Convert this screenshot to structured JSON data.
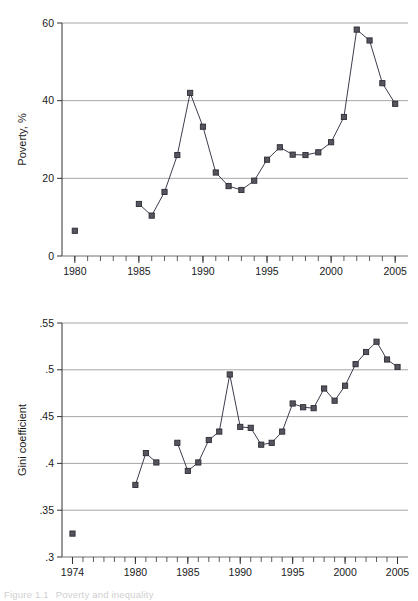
{
  "figure": {
    "caption_number": "Figure 1.1",
    "caption_text": "Poverty and inequality"
  },
  "chart_data": [
    {
      "type": "line",
      "id": "poverty",
      "title": "",
      "xlabel": "",
      "ylabel": "Poverty, %",
      "xlim": [
        1979,
        2006
      ],
      "ylim": [
        0,
        60
      ],
      "grid": true,
      "legend": "none",
      "marker": "square",
      "color": "#3d3d4f",
      "ytick_labels": [
        "0",
        "20",
        "40",
        "60"
      ],
      "ytick_values": [
        0,
        20,
        40,
        60
      ],
      "xtick_labels": [
        "1980",
        "1985",
        "1990",
        "1995",
        "2000",
        "2005"
      ],
      "xtick_values": [
        1980,
        1985,
        1990,
        1995,
        2000,
        2005
      ],
      "xminor_step": 1,
      "segments": [
        {
          "name": "isolated-1980",
          "x": [
            1980
          ],
          "y": [
            6.5
          ]
        },
        {
          "name": "main",
          "x": [
            1985,
            1986,
            1987,
            1988,
            1989,
            1990,
            1991,
            1992,
            1993,
            1994,
            1995,
            1996,
            1997,
            1998,
            1999,
            2000,
            2001,
            2002,
            2003,
            2004,
            2005
          ],
          "y": [
            13.4,
            10.4,
            16.5,
            26.0,
            42.0,
            33.3,
            21.5,
            18.0,
            17.0,
            19.4,
            24.8,
            28.0,
            26.1,
            26.0,
            26.7,
            29.3,
            35.8,
            58.3,
            55.5,
            44.5,
            39.2
          ]
        }
      ]
    },
    {
      "type": "line",
      "id": "gini",
      "title": "",
      "xlabel": "",
      "ylabel": "Gini coefficient",
      "xlim": [
        1973,
        2006
      ],
      "ylim": [
        0.3,
        0.55
      ],
      "grid": true,
      "legend": "none",
      "marker": "square",
      "color": "#3d3d4f",
      "ytick_labels": [
        ".3",
        ".35",
        ".4",
        ".45",
        ".5",
        ".55"
      ],
      "ytick_values": [
        0.3,
        0.35,
        0.4,
        0.45,
        0.5,
        0.55
      ],
      "xtick_labels": [
        "1974",
        "1980",
        "1985",
        "1990",
        "1995",
        "2000",
        "2005"
      ],
      "xtick_values": [
        1974,
        1980,
        1985,
        1990,
        1995,
        2000,
        2005
      ],
      "xminor_step": 1,
      "segments": [
        {
          "name": "isolated-1974",
          "x": [
            1974
          ],
          "y": [
            0.325
          ]
        },
        {
          "name": "early",
          "x": [
            1980,
            1981,
            1982
          ],
          "y": [
            0.377,
            0.411,
            0.401
          ]
        },
        {
          "name": "main",
          "x": [
            1984,
            1985,
            1986,
            1987,
            1988,
            1989,
            1990,
            1991,
            1992,
            1993,
            1994,
            1995,
            1996,
            1997,
            1998,
            1999,
            2000,
            2001,
            2002,
            2003,
            2004,
            2005
          ],
          "y": [
            0.422,
            0.392,
            0.401,
            0.425,
            0.434,
            0.495,
            0.439,
            0.438,
            0.42,
            0.422,
            0.434,
            0.464,
            0.46,
            0.459,
            0.48,
            0.467,
            0.483,
            0.506,
            0.519,
            0.53,
            0.511,
            0.503
          ]
        }
      ]
    }
  ]
}
